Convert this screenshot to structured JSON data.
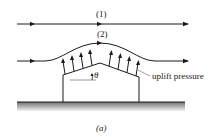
{
  "diagram": {
    "streamlines": [
      {
        "label": "(1)"
      },
      {
        "label": "(2)"
      }
    ],
    "angle_label": "θ",
    "annotation": "uplift pressure",
    "caption": "(a)",
    "colors": {
      "stroke": "#1a1a1a",
      "ground_shadow": "#9a9a9a",
      "leader": "#8a8a8a"
    }
  }
}
